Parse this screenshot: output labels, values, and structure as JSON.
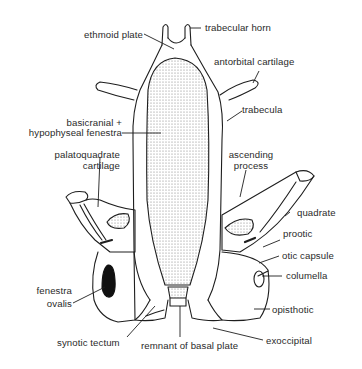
{
  "figure": {
    "colors": {
      "ink": "#1e1e1e",
      "stipple": "#9a9a9a",
      "background": "#ffffff",
      "fill_dark": "#111111"
    }
  },
  "labels": {
    "trabecular_horn": "trabecular horn",
    "ethmoid_plate": "ethmoid plate",
    "antorbital_cartilage": "antorbital cartilage",
    "trabecula": "trabecula",
    "basicranial_line1": "basicranial +",
    "basicranial_line2": "hypophyseal fenestra",
    "palatoquadrate_line1": "palatoquadrate",
    "palatoquadrate_line2": "cartilage",
    "ascending_line1": "ascending",
    "ascending_line2": "process",
    "quadrate": "quadrate",
    "prootic": "prootic",
    "otic_capsule": "otic capsule",
    "columella": "columella",
    "fenestra_line1": "fenestra",
    "fenestra_line2": "ovalis",
    "opisthotic": "opisthotic",
    "synotic_tectum": "synotic tectum",
    "remnant_basal_plate": "remnant of basal plate",
    "exoccipital": "exoccipital"
  }
}
